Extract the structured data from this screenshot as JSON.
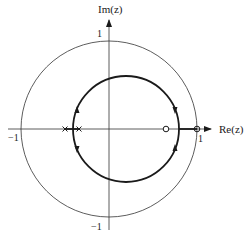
{
  "diagram": {
    "type": "root-locus-z-plane",
    "axes": {
      "x_label": "Re(z)",
      "y_label": "Im(z)",
      "x_ticks": [
        {
          "value": -1,
          "label": "−1"
        },
        {
          "value": 1,
          "label": "1"
        }
      ],
      "y_ticks": [
        {
          "value": 1,
          "label": "1"
        },
        {
          "value": -1,
          "label": "−1"
        }
      ]
    },
    "unit_circle": {
      "center": [
        0,
        0
      ],
      "radius": 1
    },
    "poles": [
      -0.5,
      -0.34
    ],
    "zeros": [
      0.65,
      1.0
    ],
    "locus_circle": {
      "center": [
        0.19,
        0
      ],
      "radius": 0.6
    },
    "real_axis_locus_segments": [
      [
        -0.5,
        -0.34
      ],
      [
        0.79,
        1.0
      ]
    ],
    "arrows": [
      {
        "position": "upper-left",
        "direction": "up"
      },
      {
        "position": "lower-left",
        "direction": "down"
      },
      {
        "position": "upper-right",
        "direction": "down"
      },
      {
        "position": "lower-right",
        "direction": "up"
      }
    ],
    "pole_marker": "x-mark",
    "zero_marker": "circle"
  }
}
